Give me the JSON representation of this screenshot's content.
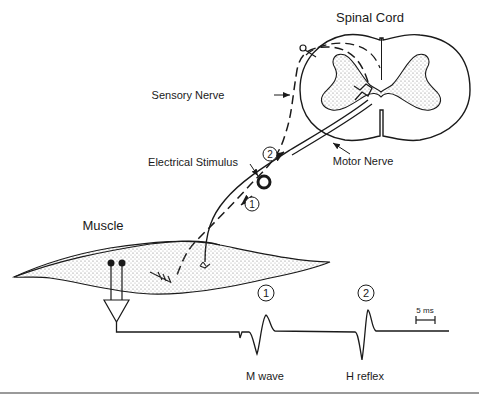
{
  "labels": {
    "spinal_cord": "Spinal Cord",
    "sensory_nerve": "Sensory Nerve",
    "motor_nerve": "Motor Nerve",
    "electrical_stimulus": "Electrical Stimulus",
    "muscle": "Muscle",
    "m_wave": "M wave",
    "h_reflex": "H reflex",
    "scale_bar": "5 ms"
  },
  "markers": {
    "one": "1",
    "two": "2"
  },
  "colors": {
    "ink": "#1a1a1a",
    "stipple": "#8a8a8a",
    "rule": "#9a9a9a"
  }
}
